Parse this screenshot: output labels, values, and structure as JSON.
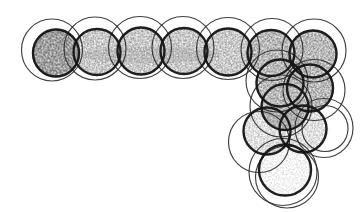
{
  "diagram": {
    "canvas": {
      "width": 361,
      "height": 212,
      "background": "#ffffff"
    },
    "style": {
      "bold_stroke": "#141414",
      "bold_width": 2.4,
      "bold_opacity": 0.95,
      "thin_stroke": "#2a2a2a",
      "thin_width": 1.15,
      "thin_opacity": 0.9
    },
    "shading": {
      "halo": {
        "gray": 0.42,
        "slope": 0.55,
        "intercept": -0.3,
        "freq": "0.45",
        "seed": 11,
        "grow": 4.5
      },
      "dark": {
        "gray": 0.2,
        "slope": 1.55,
        "intercept": -0.05,
        "freq": "0.50",
        "seed": 3
      },
      "middark": {
        "gray": 0.25,
        "slope": 1.45,
        "intercept": -0.14,
        "freq": "0.52",
        "seed": 5
      },
      "mid": {
        "gray": 0.3,
        "slope": 1.4,
        "intercept": -0.2,
        "freq": "0.55",
        "seed": 7
      },
      "midlight": {
        "gray": 0.33,
        "slope": 1.2,
        "intercept": -0.3,
        "freq": "0.55",
        "seed": 9
      },
      "light": {
        "gray": 0.38,
        "slope": 1.0,
        "intercept": -0.4,
        "freq": "0.58",
        "seed": 13
      }
    },
    "units": [
      {
        "id": "row-1",
        "shade": "dark",
        "bold": {
          "cx": 56,
          "cy": 53,
          "rx": 23,
          "ry": 23.5
        },
        "thin": {
          "cx": 52,
          "cy": 50,
          "rx": 30.5,
          "ry": 31
        }
      },
      {
        "id": "row-2",
        "shade": "mid",
        "bold": {
          "cx": 97,
          "cy": 52,
          "rx": 23.5,
          "ry": 23
        },
        "thin": {
          "cx": 95,
          "cy": 48.5,
          "rx": 31,
          "ry": 31.5
        }
      },
      {
        "id": "row-3",
        "shade": "mid",
        "bold": {
          "cx": 141,
          "cy": 51,
          "rx": 23.5,
          "ry": 23.5
        },
        "thin": {
          "cx": 140,
          "cy": 47.5,
          "rx": 31.5,
          "ry": 31
        }
      },
      {
        "id": "row-4",
        "shade": "mid",
        "bold": {
          "cx": 184,
          "cy": 51,
          "rx": 23.5,
          "ry": 23
        },
        "thin": {
          "cx": 183,
          "cy": 47.5,
          "rx": 31,
          "ry": 31
        }
      },
      {
        "id": "row-5",
        "shade": "mid",
        "bold": {
          "cx": 228,
          "cy": 52,
          "rx": 23.5,
          "ry": 23.5
        },
        "thin": {
          "cx": 228,
          "cy": 48.5,
          "rx": 31.5,
          "ry": 31
        }
      },
      {
        "id": "row-6",
        "shade": "middark",
        "bold": {
          "cx": 271,
          "cy": 53,
          "rx": 23.5,
          "ry": 23
        },
        "thin": {
          "cx": 272,
          "cy": 49.5,
          "rx": 31,
          "ry": 31
        }
      },
      {
        "id": "row-7",
        "shade": "middark",
        "bold": {
          "cx": 313,
          "cy": 54,
          "rx": 23.5,
          "ry": 23.5
        },
        "thin": {
          "cx": 314,
          "cy": 50.5,
          "rx": 32,
          "ry": 31.5
        }
      },
      {
        "id": "col-1",
        "shade": "middark",
        "bold": {
          "cx": 280,
          "cy": 83,
          "rx": 23.5,
          "ry": 23.5
        },
        "thin": {
          "cx": 277,
          "cy": 81,
          "rx": 31,
          "ry": 31
        }
      },
      {
        "id": "col-2",
        "shade": "middark",
        "bold": {
          "cx": 310,
          "cy": 88,
          "rx": 23,
          "ry": 23.5
        },
        "thin": {
          "cx": 314,
          "cy": 90,
          "rx": 31,
          "ry": 30.5
        }
      },
      {
        "id": "col-3",
        "shade": "middark",
        "bold": {
          "cx": 285,
          "cy": 107,
          "rx": 23.5,
          "ry": 23
        },
        "thin": {
          "cx": 281,
          "cy": 106,
          "rx": 31,
          "ry": 31
        }
      },
      {
        "id": "col-4",
        "shade": "midlight",
        "bold": {
          "cx": 267,
          "cy": 131,
          "rx": 23.5,
          "ry": 23.5
        },
        "thin": {
          "cx": 259,
          "cy": 142,
          "rx": 30.5,
          "ry": 30.5
        }
      },
      {
        "id": "col-5",
        "shade": "midlight",
        "bold": {
          "cx": 303,
          "cy": 129,
          "rx": 23.5,
          "ry": 23.5
        },
        "thin": {
          "cx": 324,
          "cy": 128,
          "rx": 29,
          "ry": 29.5
        },
        "extra_thin": [
          {
            "cx": 325,
            "cy": 128.5,
            "rx": 23,
            "ry": 23
          }
        ]
      },
      {
        "id": "col-6",
        "shade": "light",
        "bold": {
          "cx": 285,
          "cy": 170,
          "rx": 26,
          "ry": 25.5
        },
        "thin": {
          "cx": 283,
          "cy": 172,
          "rx": 34,
          "ry": 33.5
        },
        "extra_thin": [
          {
            "cx": 287,
            "cy": 177,
            "rx": 31.5,
            "ry": 31
          }
        ]
      }
    ],
    "patches": [
      {
        "cx": 54,
        "cy": 60,
        "rx": 19,
        "ry": 9,
        "shade": "dark"
      },
      {
        "cx": 287,
        "cy": 77,
        "rx": 27,
        "ry": 16,
        "shade": "middark"
      },
      {
        "cx": 150,
        "cy": 55,
        "rx": 70,
        "ry": 8,
        "shade": "midlight"
      }
    ]
  }
}
